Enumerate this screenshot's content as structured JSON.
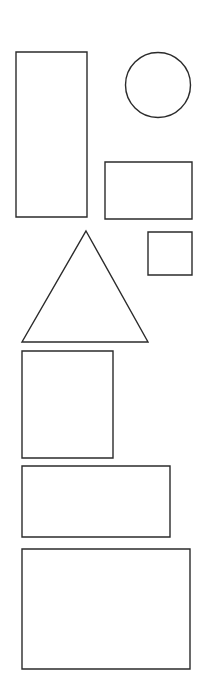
{
  "canvas": {
    "name": "shape-canvas",
    "width": 207,
    "height": 683,
    "background_color": "#ffffff",
    "stroke_color": "#2b2b2b",
    "stroke_width": 1.4,
    "fill": "none",
    "shape_count": 8,
    "description": "Outline geometric shapes on a plain white canvas"
  },
  "chart_data": {
    "type": "scatter",
    "title": "",
    "xlabel": "",
    "ylabel": "",
    "xlim": [
      0,
      207
    ],
    "ylim": [
      0,
      683
    ],
    "grid": false,
    "legend": "none",
    "shapes": [
      {
        "id": "shape-1",
        "name": "tall-rectangle",
        "kind": "rectangle",
        "x": 16,
        "y": 52,
        "width": 71,
        "height": 165,
        "cx": 51.5,
        "cy": 134.5
      },
      {
        "id": "shape-2",
        "name": "circle",
        "kind": "circle",
        "cx": 158,
        "cy": 85,
        "r": 32.5,
        "x": 125.5,
        "y": 52.5,
        "width": 65,
        "height": 65
      },
      {
        "id": "shape-3",
        "name": "medium-rectangle",
        "kind": "rectangle",
        "x": 105,
        "y": 162,
        "width": 87,
        "height": 57,
        "cx": 148.5,
        "cy": 190.5
      },
      {
        "id": "shape-4",
        "name": "small-square",
        "kind": "rectangle",
        "x": 148,
        "y": 232,
        "width": 44,
        "height": 43,
        "cx": 170,
        "cy": 253.5
      },
      {
        "id": "shape-5",
        "name": "triangle",
        "kind": "triangle",
        "apex_x": 86,
        "apex_y": 231,
        "base_left_x": 22,
        "base_right_x": 148,
        "base_y": 342,
        "points": "86,231 148,342 22,342",
        "width": 126,
        "height": 111
      },
      {
        "id": "shape-6",
        "name": "square-rectangle",
        "kind": "rectangle",
        "x": 22,
        "y": 351,
        "width": 91,
        "height": 107,
        "cx": 67.5,
        "cy": 404.5
      },
      {
        "id": "shape-7",
        "name": "wide-rectangle",
        "kind": "rectangle",
        "x": 22,
        "y": 466,
        "width": 148,
        "height": 71,
        "cx": 96,
        "cy": 501.5
      },
      {
        "id": "shape-8",
        "name": "large-rectangle",
        "kind": "rectangle",
        "x": 22,
        "y": 549,
        "width": 168,
        "height": 120,
        "cx": 106,
        "cy": 609
      }
    ]
  }
}
